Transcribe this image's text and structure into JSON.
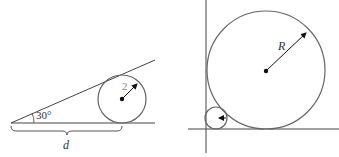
{
  "left_figure": {
    "angle_label": "30°",
    "radius_label": "2",
    "distance_label": "d"
  },
  "right_figure": {
    "radius_label": "R"
  },
  "colors": {
    "line": "#444444",
    "circle": "#666666"
  }
}
